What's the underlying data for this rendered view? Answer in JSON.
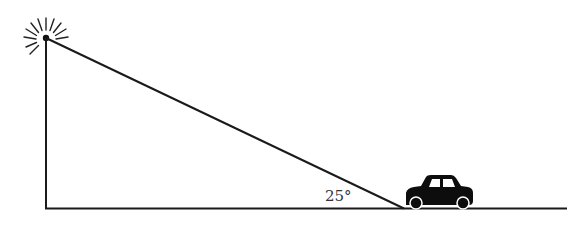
{
  "diagram": {
    "angle_label": "25°",
    "colors": {
      "line": "#1a1a1a",
      "car": "#0d0d0d",
      "text": "#333333",
      "background": "#ffffff"
    },
    "elements": [
      {
        "name": "light-source",
        "type": "sunburst"
      },
      {
        "name": "pole",
        "type": "vertical-line"
      },
      {
        "name": "ground",
        "type": "horizontal-line"
      },
      {
        "name": "sight-line",
        "type": "hypotenuse"
      },
      {
        "name": "car",
        "type": "icon"
      }
    ]
  }
}
